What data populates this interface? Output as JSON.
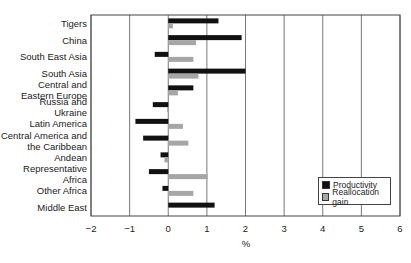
{
  "chart_data": {
    "type": "bar",
    "orientation": "horizontal",
    "title": "",
    "xlabel": "%",
    "ylabel": "",
    "xlim": [
      -2,
      6
    ],
    "xticks": [
      -2,
      -1,
      0,
      1,
      2,
      3,
      4,
      5,
      6
    ],
    "grid": "vertical",
    "legend_position": "lower right",
    "categories": [
      "Tigers",
      "China",
      "South East Asia",
      "South Asia",
      "Central and Eastern Europe",
      "Russia and Ukraine",
      "Latin America",
      "Central America and the Caribbean",
      "Andean",
      "Representative Africa",
      "Other Africa",
      "Middle East"
    ],
    "category_lines": [
      [
        "Tigers"
      ],
      [
        "China"
      ],
      [
        "South East Asia"
      ],
      [
        "South Asia"
      ],
      [
        "Central and",
        "Eastern Europe"
      ],
      [
        "Russia and",
        "Ukraine"
      ],
      [
        "Latin America"
      ],
      [
        "Central America and",
        "the Caribbean"
      ],
      [
        "Andean"
      ],
      [
        "Representative",
        "Africa"
      ],
      [
        "Other Africa"
      ],
      [
        "Middle East"
      ]
    ],
    "series": [
      {
        "name": "Productivity",
        "color": "#111111",
        "values": [
          1.3,
          1.9,
          -0.35,
          2.0,
          0.65,
          -0.4,
          -0.85,
          -0.65,
          -0.2,
          -0.5,
          -0.15,
          1.2
        ]
      },
      {
        "name": "Reallocation gain",
        "color": "#a6a6a6",
        "values": [
          0.12,
          0.72,
          0.65,
          0.78,
          0.25,
          -0.03,
          0.38,
          0.52,
          -0.1,
          1.02,
          0.65,
          0.02
        ]
      }
    ]
  },
  "legend": {
    "productivity": "Productivity",
    "reallocation": "Reallocation gain"
  },
  "axis": {
    "x_label": "%"
  }
}
